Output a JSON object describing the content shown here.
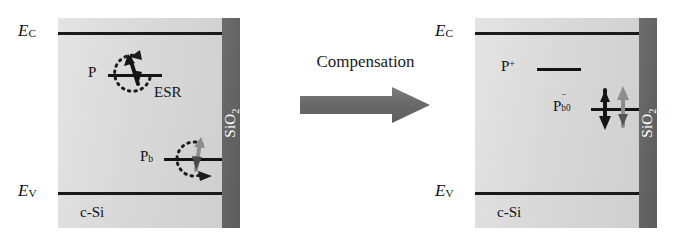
{
  "figure": {
    "panels": [
      {
        "id": "left",
        "state": "before-compensation",
        "substrate_label": "c-Si",
        "oxide_label_main": "SiO",
        "oxide_label_sub": "2",
        "bands": {
          "conduction_symbol": "E",
          "conduction_sub": "C",
          "valence_symbol": "E",
          "valence_sub": "V"
        },
        "levels": [
          {
            "name": "phosphorus-donor",
            "label_main": "P",
            "label_sup": "",
            "label_sub": "",
            "spin": "up",
            "spin_shade": "dark",
            "has_transition_arc": true,
            "arc_label": "ESR"
          },
          {
            "name": "pb-interface-defect",
            "label_main": "P",
            "label_sup": "",
            "label_sub": "b",
            "spin": "up",
            "spin_shade": "light",
            "has_transition_arc": true,
            "arc_label": ""
          }
        ]
      },
      {
        "id": "right",
        "state": "after-compensation",
        "substrate_label": "c-Si",
        "oxide_label_main": "SiO",
        "oxide_label_sub": "2",
        "bands": {
          "conduction_symbol": "E",
          "conduction_sub": "C",
          "valence_symbol": "E",
          "valence_sub": "V"
        },
        "levels": [
          {
            "name": "ionized-phosphorus-donor",
            "label_main": "P",
            "label_sup": "+",
            "label_sub": "",
            "spin": "none",
            "spin_shade": "",
            "has_transition_arc": false,
            "arc_label": ""
          },
          {
            "name": "negatively-charged-pb0-defect",
            "label_main": "P",
            "label_sup": "−",
            "label_sub": "b0",
            "spin": "paired",
            "spin_shade": "mixed",
            "has_transition_arc": false,
            "arc_label": ""
          }
        ]
      }
    ],
    "transition": {
      "label": "Compensation",
      "arrow_direction": "right"
    },
    "colors": {
      "silicon": "#dcdcdc",
      "oxide": "#636363",
      "band_line": "#1a1a1a",
      "text": "#111111",
      "arrow": "#6f6f6f",
      "spin_dark": "#151515",
      "spin_light": "#8a8a8a"
    }
  }
}
